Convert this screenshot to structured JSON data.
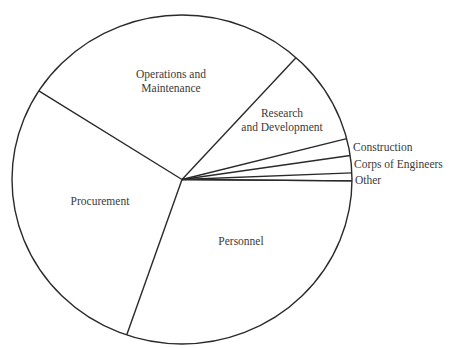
{
  "chart_data": {
    "type": "pie",
    "title": "",
    "categories": [
      "Personnel",
      "Procurement",
      "Operations and Maintenance",
      "Research and Development",
      "Construction",
      "Corps of Engineers",
      "Other"
    ],
    "values": [
      30.1,
      28.8,
      27.7,
      9.3,
      1.7,
      1.7,
      0.7
    ],
    "unit": "percent (estimated from slice angles)",
    "slices": [
      {
        "label": "Personnel",
        "value": 30.1,
        "start_deg": 251.0,
        "end_deg": 359.5,
        "label_lines": [
          "Personnel"
        ],
        "label_pos": [
          241,
          245
        ],
        "label_inside": true
      },
      {
        "label": "Procurement",
        "value": 28.8,
        "start_deg": 147.4,
        "end_deg": 251.0,
        "label_lines": [
          "Procurement"
        ],
        "label_pos": [
          100,
          205
        ],
        "label_inside": true
      },
      {
        "label": "Operations and Maintenance",
        "value": 27.7,
        "start_deg": 47.8,
        "end_deg": 147.4,
        "label_lines": [
          "Operations and",
          "Maintenance"
        ],
        "label_pos": [
          171,
          78
        ],
        "label_inside": true
      },
      {
        "label": "Research and Development",
        "value": 9.3,
        "start_deg": 14.4,
        "end_deg": 47.8,
        "label_lines": [
          "Research",
          "and Development"
        ],
        "label_pos": [
          282,
          117
        ],
        "label_inside": true
      },
      {
        "label": "Construction",
        "value": 1.7,
        "start_deg": 8.4,
        "end_deg": 14.4,
        "label_lines": [
          "Construction"
        ],
        "label_pos": [
          353,
          151
        ],
        "label_inside": false
      },
      {
        "label": "Corps of Engineers",
        "value": 1.7,
        "start_deg": 2.3,
        "end_deg": 8.4,
        "label_lines": [
          "Corps of Engineers"
        ],
        "label_pos": [
          354,
          168
        ],
        "label_inside": false
      },
      {
        "label": "Other",
        "value": 0.7,
        "start_deg": -0.5,
        "end_deg": 2.3,
        "label_lines": [
          "Other"
        ],
        "label_pos": [
          355,
          184
        ],
        "label_inside": false
      }
    ],
    "center": [
      182,
      179.5
    ],
    "radius_x": 170,
    "radius_y": 164.5,
    "legend": "none (labels placed on/next to slices)",
    "fill": "none (white slices with black outlines)"
  }
}
